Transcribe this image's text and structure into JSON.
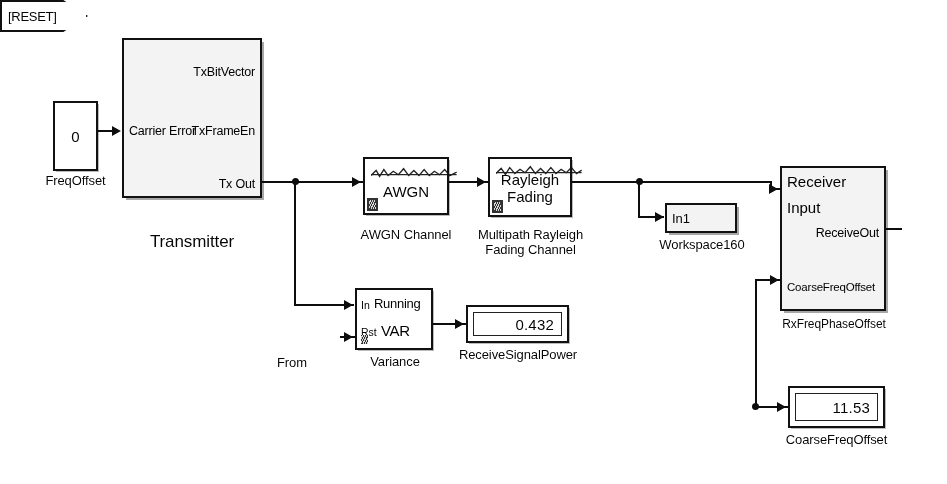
{
  "diagram": {
    "background_color": "#ffffff",
    "wire_color": "#191919",
    "subsystem_fill": "#e7e7e7",
    "block_fill": "#f6f6f6"
  },
  "blocks": {
    "freq_offset_const": {
      "value": "0",
      "caption": "FreqOffset"
    },
    "transmitter": {
      "caption": "Transmitter",
      "ports": {
        "input_carrier_error": "Carrier Error",
        "output_tx_bit_vector": "TxBitVector",
        "output_tx_frame_en": "TxFrameEn",
        "output_tx_out": "Tx Out"
      }
    },
    "awgn_channel": {
      "label": "AWGN",
      "caption": "AWGN Channel",
      "icon": "noise-waveform-icon"
    },
    "rayleigh_channel": {
      "label_top": "Rayleigh",
      "label_bottom": "Fading",
      "caption": "Multipath Rayleigh\nFading Channel",
      "icon": "noise-waveform-icon"
    },
    "workspace": {
      "port": "In1",
      "caption": "Workspace160"
    },
    "receiver": {
      "title_line1": "Receiver",
      "title_line2": "Input",
      "caption": "RxFreqPhaseOffset",
      "ports": {
        "output_receive_out": "ReceiveOut",
        "input_coarse_freq_offset": "CoarseFreqOffset"
      }
    },
    "from_block": {
      "tag": "[RESET]",
      "caption": "From"
    },
    "variance": {
      "line1": "Running",
      "line2": "VAR",
      "caption": "Variance",
      "ports": {
        "input_in": "In",
        "input_rst": "Rst"
      }
    },
    "receive_signal_power_display": {
      "value": "0.432",
      "caption": "ReceiveSignalPower"
    },
    "coarse_freq_offset_display": {
      "value": "11.53",
      "caption": "CoarseFreqOffset"
    }
  }
}
